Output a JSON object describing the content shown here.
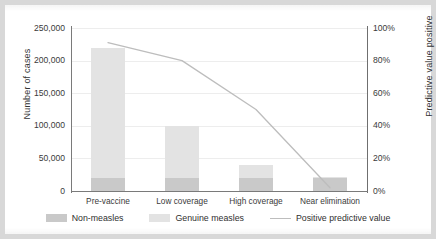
{
  "chart_data": {
    "type": "bar",
    "subtype": "stacked-bar-with-line-overlay",
    "title": "",
    "categories": [
      "Pre-vaccine",
      "Low coverage",
      "High coverage",
      "Near elimination"
    ],
    "series": [
      {
        "name": "Non-measles",
        "type": "bar",
        "stack": "cases",
        "axis": "left",
        "color": "#c9c9c9",
        "values": [
          20000,
          20000,
          20000,
          20000
        ]
      },
      {
        "name": "Genuine measles",
        "type": "bar",
        "stack": "cases",
        "axis": "left",
        "color": "#e3e3e3",
        "values": [
          200000,
          80000,
          20000,
          1000
        ]
      },
      {
        "name": "Positive predictive value",
        "type": "line",
        "axis": "right",
        "color": "#bdbdbd",
        "values": [
          0.91,
          0.8,
          0.5,
          0.02
        ]
      }
    ],
    "totals": [
      220000,
      100000,
      40000,
      21000
    ],
    "xlabel": "",
    "ylabel": "Number of cases",
    "y2label": "Predictive value positive",
    "ylim": [
      0,
      250000
    ],
    "y2lim": [
      0,
      1
    ],
    "yticks": [
      0,
      50000,
      100000,
      150000,
      200000,
      250000
    ],
    "ytick_labels": [
      "0",
      "50,000",
      "100,000",
      "150,000",
      "200,000",
      "250,000"
    ],
    "y2ticks": [
      0,
      0.2,
      0.4,
      0.6,
      0.8,
      1.0
    ],
    "y2tick_labels": [
      "0%",
      "20%",
      "40%",
      "60%",
      "80%",
      "100%"
    ],
    "grid": true,
    "grid_axis": "y",
    "legend_position": "bottom"
  },
  "axes": {
    "left_title": "Number of cases",
    "right_title": "Predictive value positive",
    "left_ticks": [
      "250,000",
      "200,000",
      "150,000",
      "100,000",
      "50,000",
      "0"
    ],
    "right_ticks": [
      "100%",
      "80%",
      "60%",
      "40%",
      "20%",
      "0%"
    ],
    "category_labels": [
      "Pre-vaccine",
      "Low coverage",
      "High coverage",
      "Near elimination"
    ]
  },
  "legend": {
    "items": [
      {
        "label": "Non-measles",
        "marker": "swatch",
        "color": "#c9c9c9"
      },
      {
        "label": "Genuine measles",
        "marker": "swatch",
        "color": "#e3e3e3"
      },
      {
        "label": "Positive predictive value",
        "marker": "line",
        "color": "#bdbdbd"
      }
    ]
  },
  "colors": {
    "non_measles": "#c9c9c9",
    "genuine_measles": "#e3e3e3",
    "ppv_line": "#bdbdbd",
    "axis": "#7a7a7a",
    "grid": "#ededed",
    "page_background": "#d8d8d8",
    "figure_background": "#ffffff"
  }
}
